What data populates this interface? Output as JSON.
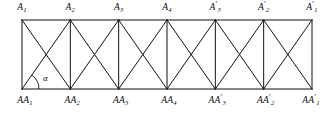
{
  "figure": {
    "background_color": "#ffffff",
    "line_color": "#111111",
    "chord_width": 2.6,
    "web_width": 1.7,
    "geometry": {
      "left_x": 22,
      "right_x": 312,
      "top_y": 20,
      "bottom_y": 89,
      "panel_count": 6,
      "panel_width": 48.33,
      "node_x": [
        22,
        70.33,
        118.67,
        167,
        215.33,
        263.67,
        312
      ]
    }
  },
  "angle": {
    "symbol": "α",
    "label_x": 43,
    "label_y": 73,
    "arc_radius": 17,
    "vertex_x": 22,
    "vertex_y": 89
  },
  "top_nodes": [
    {
      "name": "node-a1",
      "base": "A",
      "sub": "1",
      "prime": "",
      "x": 22,
      "y": 2
    },
    {
      "name": "node-a2",
      "base": "A",
      "sub": "2",
      "prime": "",
      "x": 70.33,
      "y": 2
    },
    {
      "name": "node-a3",
      "base": "A",
      "sub": "3",
      "prime": "",
      "x": 118.67,
      "y": 2
    },
    {
      "name": "node-a4",
      "base": "A",
      "sub": "4",
      "prime": "",
      "x": 167,
      "y": 2
    },
    {
      "name": "node-a3-prime",
      "base": "A",
      "sub": "3",
      "prime": "′",
      "x": 215.33,
      "y": 2
    },
    {
      "name": "node-a2-prime",
      "base": "A",
      "sub": "2",
      "prime": "′",
      "x": 263.67,
      "y": 2
    },
    {
      "name": "node-a1-prime",
      "base": "A",
      "sub": "1",
      "prime": "′",
      "x": 312,
      "y": 2
    }
  ],
  "bottom_nodes": [
    {
      "name": "node-aa1",
      "base": "AA",
      "sub": "1",
      "prime": "",
      "x": 25,
      "y": 95
    },
    {
      "name": "node-aa2",
      "base": "AA",
      "sub": "2",
      "prime": "",
      "x": 72.33,
      "y": 95
    },
    {
      "name": "node-aa3",
      "base": "AA",
      "sub": "3",
      "prime": "",
      "x": 120.67,
      "y": 95
    },
    {
      "name": "node-aa4",
      "base": "AA",
      "sub": "4",
      "prime": "",
      "x": 169,
      "y": 95
    },
    {
      "name": "node-aa3-prime",
      "base": "AA",
      "sub": "3",
      "prime": "′",
      "x": 217.33,
      "y": 95
    },
    {
      "name": "node-aa2-prime",
      "base": "AA",
      "sub": "2",
      "prime": "′",
      "x": 265.67,
      "y": 95
    },
    {
      "name": "node-aa1-prime",
      "base": "AA",
      "sub": "1",
      "prime": "′",
      "x": 311,
      "y": 95
    }
  ]
}
